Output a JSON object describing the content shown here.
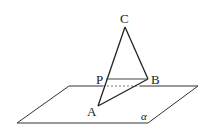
{
  "diagram": {
    "title": "",
    "points": {
      "C": {
        "label": "C",
        "x": 125,
        "y": 27
      },
      "B": {
        "label": "B",
        "x": 148,
        "y": 79
      },
      "A": {
        "label": "A",
        "x": 98,
        "y": 106
      },
      "P": {
        "label": "P",
        "x": 106,
        "y": 79
      }
    },
    "plane": {
      "label": "α",
      "corners": [
        [
          69,
          86
        ],
        [
          198,
          86
        ],
        [
          148,
          123
        ],
        [
          17,
          123
        ]
      ]
    },
    "segments": [
      "CA",
      "CB",
      "AB",
      "PB"
    ],
    "hidden_segment": "plane edge behind triangle (dashed)"
  }
}
